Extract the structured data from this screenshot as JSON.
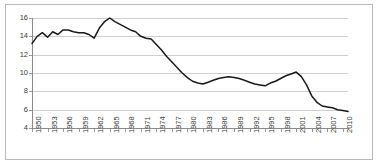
{
  "chart_data": {
    "type": "line",
    "title": "",
    "subtitle": "",
    "xlabel": "",
    "ylabel": "",
    "grid": true,
    "legend": false,
    "legend_position": "none",
    "line_color": "#1a1a1a",
    "gridline_color": "#cfcfcf",
    "axis_color": "#8a8a8a",
    "border_color": "#b9b9b9",
    "background": "#ffffff",
    "xlim": [
      1950,
      2011
    ],
    "ylim": [
      4,
      16
    ],
    "ytick_labels": [
      "16",
      "14",
      "12",
      "10",
      "8",
      "6",
      "4"
    ],
    "ytick_values": [
      16,
      14,
      12,
      10,
      8,
      6,
      4
    ],
    "xtick_labels": [
      "1950",
      "1953",
      "1956",
      "1959",
      "1962",
      "1965",
      "1968",
      "1971",
      "1974",
      "1977",
      "1980",
      "1983",
      "1986",
      "1989",
      "1992",
      "1995",
      "1998",
      "2001",
      "2004",
      "2007",
      "2010"
    ],
    "xtick_values": [
      1950,
      1953,
      1956,
      1959,
      1962,
      1965,
      1968,
      1971,
      1974,
      1977,
      1980,
      1983,
      1986,
      1989,
      1992,
      1995,
      1998,
      2001,
      2004,
      2007,
      2010
    ],
    "x": [
      1950,
      1951,
      1952,
      1953,
      1954,
      1955,
      1956,
      1957,
      1958,
      1959,
      1960,
      1961,
      1962,
      1963,
      1964,
      1965,
      1966,
      1967,
      1968,
      1969,
      1970,
      1971,
      1972,
      1973,
      1974,
      1975,
      1976,
      1977,
      1978,
      1979,
      1980,
      1981,
      1982,
      1983,
      1984,
      1985,
      1986,
      1987,
      1988,
      1989,
      1990,
      1991,
      1992,
      1993,
      1994,
      1995,
      1996,
      1997,
      1998,
      1999,
      2000,
      2001,
      2002,
      2003,
      2004,
      2005,
      2006,
      2007,
      2008,
      2009,
      2010,
      2011
    ],
    "values": [
      13.2,
      14.0,
      14.4,
      13.9,
      14.5,
      14.2,
      14.7,
      14.7,
      14.5,
      14.4,
      14.4,
      14.2,
      13.8,
      14.9,
      15.6,
      16.0,
      15.6,
      15.3,
      15.0,
      14.7,
      14.5,
      14.0,
      13.8,
      13.7,
      13.1,
      12.5,
      11.8,
      11.2,
      10.6,
      10.0,
      9.5,
      9.1,
      8.9,
      8.8,
      9.0,
      9.2,
      9.4,
      9.5,
      9.6,
      9.5,
      9.4,
      9.2,
      9.0,
      8.8,
      8.7,
      8.6,
      8.9,
      9.1,
      9.4,
      9.7,
      9.9,
      10.1,
      9.6,
      8.7,
      7.5,
      6.8,
      6.4,
      6.3,
      6.2,
      6.0,
      5.9,
      5.8
    ],
    "series": [
      {
        "name": "series-1",
        "values": [
          13.2,
          14.0,
          14.4,
          13.9,
          14.5,
          14.2,
          14.7,
          14.7,
          14.5,
          14.4,
          14.4,
          14.2,
          13.8,
          14.9,
          15.6,
          16.0,
          15.6,
          15.3,
          15.0,
          14.7,
          14.5,
          14.0,
          13.8,
          13.7,
          13.1,
          12.5,
          11.8,
          11.2,
          10.6,
          10.0,
          9.5,
          9.1,
          8.9,
          8.8,
          9.0,
          9.2,
          9.4,
          9.5,
          9.6,
          9.5,
          9.4,
          9.2,
          9.0,
          8.8,
          8.7,
          8.6,
          8.9,
          9.1,
          9.4,
          9.7,
          9.9,
          10.1,
          9.6,
          8.7,
          7.5,
          6.8,
          6.4,
          6.3,
          6.2,
          6.0,
          5.9,
          5.8
        ]
      }
    ]
  }
}
